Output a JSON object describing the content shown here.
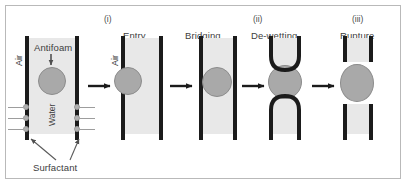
{
  "figure": {
    "title": "",
    "border_color": "#b9b9b9",
    "background": "#ffffff"
  },
  "colors": {
    "wall": "#1b1b1b",
    "water_film": "#e8e8e8",
    "droplet": "#a9a9a9",
    "droplet_outline": "#8c8c8c",
    "surfactant": "#b0b0b0",
    "text": "#3d3d3d",
    "arrow": "#1b1b1b",
    "leader": "#5a5a5a"
  },
  "stage_labels": {
    "roman_i": "(i)",
    "roman_ii": "(ii)",
    "roman_iii": "(iii)"
  },
  "panels": [
    {
      "id": "initial-film",
      "title": "",
      "annotations": {
        "air": "Air",
        "antifoam": "Antifoam",
        "water": "Water",
        "surfactant": "Surfactant"
      }
    },
    {
      "id": "entry",
      "title": "Entry",
      "roman": "(i)",
      "annotations": {
        "air": "Air"
      }
    },
    {
      "id": "bridging",
      "title": "Bridging",
      "roman": ""
    },
    {
      "id": "dewetting",
      "title": "De-wetting",
      "roman": "(ii)"
    },
    {
      "id": "rupture",
      "title": "Rupture",
      "roman": "(iii)"
    }
  ],
  "arrows": [
    {
      "id": "arrow-1",
      "from": "initial-film",
      "to": "entry"
    },
    {
      "id": "arrow-2",
      "from": "entry",
      "to": "bridging"
    },
    {
      "id": "arrow-3",
      "from": "bridging",
      "to": "dewetting"
    },
    {
      "id": "arrow-4",
      "from": "dewetting",
      "to": "rupture"
    }
  ]
}
